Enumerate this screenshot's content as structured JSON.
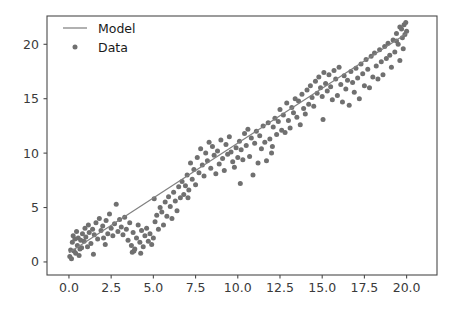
{
  "chart_data": {
    "type": "scatter",
    "title": "",
    "xlabel": "",
    "ylabel": "",
    "xlim": [
      -1.3,
      21.8
    ],
    "ylim": [
      -1.2,
      22.6
    ],
    "grid": false,
    "legend_position": "upper left",
    "xticks": [
      "0.0",
      "2.5",
      "5.0",
      "7.5",
      "10.0",
      "12.5",
      "15.0",
      "17.5",
      "20.0"
    ],
    "xtick_values": [
      0,
      2.5,
      5,
      7.5,
      10,
      12.5,
      15,
      17.5,
      20
    ],
    "yticks": [
      "0",
      "5",
      "10",
      "15",
      "20"
    ],
    "ytick_values": [
      0,
      5,
      10,
      15,
      20
    ],
    "colors": {
      "model": "#808080",
      "data": "#707070",
      "axis": "#4a4a4a",
      "background": "#ffffff"
    },
    "series": [
      {
        "name": "Model",
        "type": "line",
        "color": "#808080",
        "x": [
          0.0,
          20.0
        ],
        "y": [
          0.85,
          21.0
        ]
      },
      {
        "name": "Data",
        "type": "scatter",
        "color": "#707070",
        "marker": "circle",
        "marker_size": 5,
        "points": [
          [
            0.05,
            0.5
          ],
          [
            0.1,
            1.1
          ],
          [
            0.15,
            0.3
          ],
          [
            0.2,
            1.8
          ],
          [
            0.25,
            2.4
          ],
          [
            0.3,
            1.0
          ],
          [
            0.35,
            2.1
          ],
          [
            0.4,
            0.8
          ],
          [
            0.45,
            2.8
          ],
          [
            0.5,
            1.5
          ],
          [
            0.55,
            2.2
          ],
          [
            0.6,
            0.6
          ],
          [
            0.7,
            2.0
          ],
          [
            0.75,
            1.3
          ],
          [
            0.8,
            2.6
          ],
          [
            0.9,
            1.9
          ],
          [
            0.95,
            3.1
          ],
          [
            1.0,
            2.3
          ],
          [
            1.1,
            1.4
          ],
          [
            1.15,
            3.4
          ],
          [
            1.2,
            2.7
          ],
          [
            1.3,
            1.7
          ],
          [
            1.4,
            3.0
          ],
          [
            1.5,
            2.5
          ],
          [
            1.6,
            3.6
          ],
          [
            1.7,
            2.1
          ],
          [
            1.8,
            4.0
          ],
          [
            1.9,
            2.9
          ],
          [
            2.0,
            3.3
          ],
          [
            2.05,
            2.2
          ],
          [
            2.2,
            3.8
          ],
          [
            2.3,
            2.6
          ],
          [
            2.4,
            4.4
          ],
          [
            2.5,
            3.1
          ],
          [
            2.6,
            2.4
          ],
          [
            2.7,
            3.5
          ],
          [
            2.8,
            5.3
          ],
          [
            2.9,
            2.8
          ],
          [
            3.0,
            3.9
          ],
          [
            3.1,
            3.2
          ],
          [
            3.2,
            2.5
          ],
          [
            3.3,
            4.1
          ],
          [
            3.4,
            3.0
          ],
          [
            3.5,
            2.0
          ],
          [
            3.6,
            3.6
          ],
          [
            3.7,
            1.5
          ],
          [
            3.75,
            0.9
          ],
          [
            3.8,
            2.7
          ],
          [
            3.9,
            1.2
          ],
          [
            4.0,
            2.2
          ],
          [
            4.1,
            3.4
          ],
          [
            4.2,
            1.8
          ],
          [
            4.3,
            2.9
          ],
          [
            4.4,
            1.4
          ],
          [
            4.5,
            2.4
          ],
          [
            4.6,
            3.1
          ],
          [
            4.7,
            1.9
          ],
          [
            4.8,
            2.6
          ],
          [
            4.9,
            1.6
          ],
          [
            5.0,
            2.2
          ],
          [
            5.1,
            3.7
          ],
          [
            5.2,
            4.3
          ],
          [
            5.3,
            3.0
          ],
          [
            5.4,
            5.0
          ],
          [
            5.5,
            4.6
          ],
          [
            5.6,
            3.4
          ],
          [
            5.7,
            5.5
          ],
          [
            5.8,
            4.2
          ],
          [
            5.9,
            6.0
          ],
          [
            6.0,
            5.1
          ],
          [
            6.1,
            4.0
          ],
          [
            6.2,
            6.4
          ],
          [
            6.3,
            5.6
          ],
          [
            6.4,
            4.7
          ],
          [
            6.5,
            6.9
          ],
          [
            6.6,
            5.9
          ],
          [
            6.7,
            7.4
          ],
          [
            6.8,
            6.2
          ],
          [
            6.9,
            7.0
          ],
          [
            7.0,
            8.0
          ],
          [
            7.1,
            6.6
          ],
          [
            7.2,
            9.1
          ],
          [
            7.3,
            7.6
          ],
          [
            7.4,
            8.5
          ],
          [
            7.5,
            7.1
          ],
          [
            7.6,
            9.6
          ],
          [
            7.7,
            8.2
          ],
          [
            7.8,
            10.4
          ],
          [
            7.9,
            8.9
          ],
          [
            8.0,
            7.9
          ],
          [
            8.1,
            10.0
          ],
          [
            8.2,
            9.3
          ],
          [
            8.3,
            11.0
          ],
          [
            8.4,
            8.6
          ],
          [
            8.5,
            10.6
          ],
          [
            8.6,
            9.8
          ],
          [
            8.7,
            8.1
          ],
          [
            8.8,
            10.2
          ],
          [
            8.9,
            9.0
          ],
          [
            9.0,
            11.2
          ],
          [
            9.1,
            9.5
          ],
          [
            9.2,
            8.4
          ],
          [
            9.3,
            10.8
          ],
          [
            9.4,
            9.9
          ],
          [
            9.5,
            11.5
          ],
          [
            9.6,
            10.1
          ],
          [
            9.7,
            9.2
          ],
          [
            9.8,
            8.7
          ],
          [
            9.9,
            10.5
          ],
          [
            10.0,
            9.6
          ],
          [
            10.1,
            11.1
          ],
          [
            10.2,
            10.3
          ],
          [
            10.3,
            9.4
          ],
          [
            10.4,
            11.8
          ],
          [
            10.5,
            10.7
          ],
          [
            10.6,
            12.2
          ],
          [
            10.7,
            9.7
          ],
          [
            10.8,
            11.4
          ],
          [
            10.9,
            8.0
          ],
          [
            11.0,
            10.9
          ],
          [
            11.1,
            12.0
          ],
          [
            11.2,
            9.1
          ],
          [
            11.3,
            11.6
          ],
          [
            11.4,
            10.4
          ],
          [
            11.5,
            12.5
          ],
          [
            11.6,
            11.0
          ],
          [
            11.7,
            9.3
          ],
          [
            11.8,
            12.8
          ],
          [
            11.9,
            11.3
          ],
          [
            12.0,
            10.0
          ],
          [
            12.1,
            12.4
          ],
          [
            12.2,
            13.2
          ],
          [
            12.3,
            11.7
          ],
          [
            12.4,
            12.9
          ],
          [
            12.5,
            14.0
          ],
          [
            12.6,
            12.1
          ],
          [
            12.7,
            13.5
          ],
          [
            12.8,
            11.9
          ],
          [
            12.9,
            14.6
          ],
          [
            13.0,
            13.0
          ],
          [
            13.1,
            12.3
          ],
          [
            13.2,
            14.2
          ],
          [
            13.3,
            13.7
          ],
          [
            13.4,
            15.0
          ],
          [
            13.5,
            13.3
          ],
          [
            13.6,
            14.8
          ],
          [
            13.7,
            12.6
          ],
          [
            13.8,
            15.4
          ],
          [
            13.9,
            14.1
          ],
          [
            14.0,
            13.6
          ],
          [
            14.1,
            15.8
          ],
          [
            14.2,
            14.5
          ],
          [
            14.3,
            16.2
          ],
          [
            14.4,
            15.1
          ],
          [
            14.5,
            14.3
          ],
          [
            14.6,
            16.6
          ],
          [
            14.7,
            15.5
          ],
          [
            14.8,
            17.0
          ],
          [
            14.9,
            16.0
          ],
          [
            15.0,
            15.2
          ],
          [
            15.1,
            17.4
          ],
          [
            15.2,
            16.4
          ],
          [
            15.3,
            15.7
          ],
          [
            15.4,
            17.2
          ],
          [
            15.5,
            16.1
          ],
          [
            15.6,
            14.9
          ],
          [
            15.7,
            17.6
          ],
          [
            15.8,
            16.8
          ],
          [
            15.9,
            15.3
          ],
          [
            16.0,
            17.9
          ],
          [
            16.1,
            16.3
          ],
          [
            16.2,
            14.7
          ],
          [
            16.3,
            17.1
          ],
          [
            16.4,
            15.9
          ],
          [
            16.5,
            16.7
          ],
          [
            16.6,
            14.4
          ],
          [
            16.7,
            17.5
          ],
          [
            16.8,
            16.5
          ],
          [
            16.9,
            15.6
          ],
          [
            17.0,
            17.8
          ],
          [
            17.1,
            16.9
          ],
          [
            17.2,
            15.0
          ],
          [
            17.3,
            18.2
          ],
          [
            17.4,
            17.3
          ],
          [
            17.5,
            16.2
          ],
          [
            17.6,
            18.6
          ],
          [
            17.7,
            17.7
          ],
          [
            17.8,
            16.0
          ],
          [
            17.9,
            18.9
          ],
          [
            18.0,
            17.0
          ],
          [
            18.1,
            19.2
          ],
          [
            18.2,
            18.0
          ],
          [
            18.3,
            16.8
          ],
          [
            18.4,
            19.5
          ],
          [
            18.5,
            18.4
          ],
          [
            18.6,
            17.2
          ],
          [
            18.7,
            19.8
          ],
          [
            18.8,
            18.7
          ],
          [
            18.9,
            20.1
          ],
          [
            19.0,
            19.0
          ],
          [
            19.1,
            17.9
          ],
          [
            19.2,
            20.4
          ],
          [
            19.3,
            19.3
          ],
          [
            19.4,
            21.0
          ],
          [
            19.5,
            20.0
          ],
          [
            19.6,
            18.5
          ],
          [
            19.7,
            21.4
          ],
          [
            19.75,
            20.6
          ],
          [
            19.8,
            19.6
          ],
          [
            19.85,
            21.8
          ],
          [
            19.9,
            20.9
          ],
          [
            19.95,
            22.0
          ],
          [
            20.0,
            21.2
          ],
          [
            19.6,
            21.6
          ],
          [
            19.4,
            20.3
          ],
          [
            3.85,
            1.0
          ],
          [
            4.25,
            0.8
          ],
          [
            2.15,
            1.6
          ],
          [
            1.45,
            0.7
          ],
          [
            0.65,
            1.2
          ],
          [
            10.15,
            7.2
          ],
          [
            12.05,
            10.6
          ],
          [
            15.05,
            13.1
          ],
          [
            7.05,
            5.9
          ],
          [
            5.05,
            5.8
          ]
        ]
      }
    ],
    "legend": [
      {
        "label": "Model",
        "type": "line",
        "color": "#808080"
      },
      {
        "label": "Data",
        "type": "marker",
        "color": "#707070"
      }
    ]
  }
}
